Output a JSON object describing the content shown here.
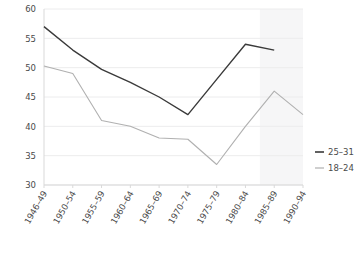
{
  "chart_data": {
    "type": "line",
    "title": "",
    "subtitle": "",
    "xlabel": "",
    "ylabel": "",
    "categories": [
      "1946–49",
      "1950–54",
      "1955–59",
      "1960–64",
      "1965–69",
      "1970–74",
      "1975–79",
      "1980–84",
      "1985–89",
      "1990–94"
    ],
    "ylim": [
      30,
      60
    ],
    "yticks": [
      30,
      35,
      40,
      45,
      50,
      55,
      60
    ],
    "ytick_labels": [
      "30",
      "35",
      "40",
      "45",
      "50",
      "55",
      "60"
    ],
    "grid": true,
    "legend_position": "right",
    "series": [
      {
        "name": "25–31",
        "color": "#3a3a3a",
        "values": [
          57,
          53,
          49.7,
          47.5,
          45,
          42,
          48,
          54,
          53,
          null
        ]
      },
      {
        "name": "18–24",
        "color": "#b0b0b0",
        "values": [
          50.3,
          49,
          41,
          40,
          38,
          37.8,
          33.5,
          40,
          46,
          42
        ]
      }
    ],
    "shaded_region": {
      "from_category": "1985–89",
      "to_category": "1990–94",
      "color": "#f6f6f7"
    }
  },
  "legend": {
    "items": [
      {
        "label": "25–31",
        "color": "#3a3a3a"
      },
      {
        "label": "18–24",
        "color": "#b0b0b0"
      }
    ]
  }
}
